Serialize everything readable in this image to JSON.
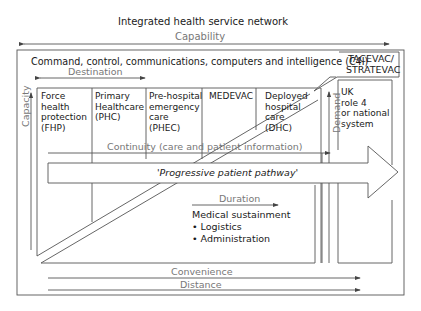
{
  "title": "Integrated health service network",
  "axes": {
    "capability": "Capability",
    "destination": "Destination",
    "capacity": "Capacity",
    "demand": "Demand",
    "continuity": "Continuity (care and patient information)",
    "duration": "Duration",
    "convenience": "Convenience",
    "distance": "Distance"
  },
  "c4i": "Command, control, communications, computers and intelligence (C4I)",
  "callout": {
    "line1": "TACEVAC/",
    "line2": "STRATEVAC"
  },
  "columns": [
    {
      "lines": [
        "Force",
        "health",
        "protection",
        "(FHP)"
      ]
    },
    {
      "lines": [
        "Primary",
        "Healthcare",
        "(PHC)"
      ]
    },
    {
      "lines": [
        "Pre-hospital",
        "emergency",
        "care",
        "(PHEC)"
      ]
    },
    {
      "lines": [
        "MEDEVAC"
      ]
    },
    {
      "lines": [
        "Deployed",
        "hospital",
        "care",
        "(DHC)"
      ]
    }
  ],
  "uk_box": {
    "lines": [
      "UK",
      "role 4",
      "or national",
      "system"
    ]
  },
  "pathway": "'Progressive patient pathway'",
  "sustainment": {
    "title": "Medical sustainment",
    "items": [
      "• Logistics",
      "• Administration"
    ]
  },
  "colors": {
    "line": "#555555",
    "text": "#1a1a1a",
    "grey_text": "#777777"
  }
}
